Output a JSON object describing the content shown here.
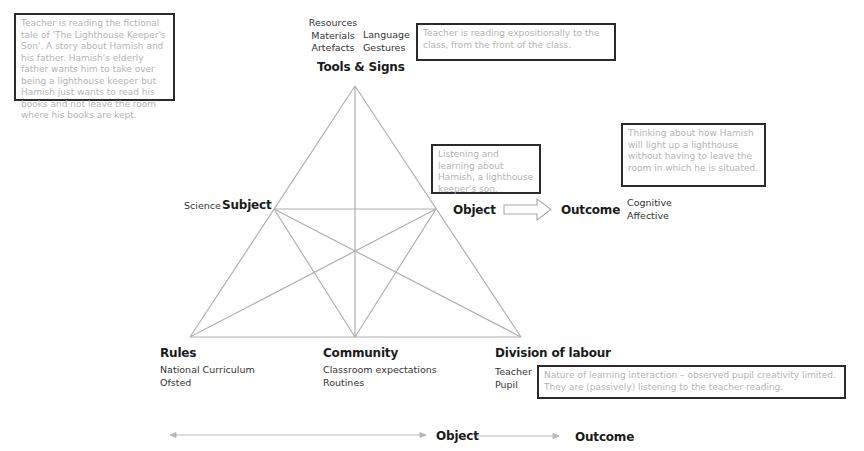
{
  "notes": {
    "tools_context": "Teacher is reading the fictional tale of 'The Lighthouse Keeper's Son'. A story about Hamish and his father. Hamish's elderly father wants him to take over being a lighthouse keeper but Hamish just wants to read his books and not leave the room where his books are kept.",
    "tools_signs": "Teacher is reading expositionally to the class, from the front of the class.",
    "object": "Listening and learning about Hamish, a lighthouse keeper's son.",
    "outcome": "Thinking about how Hamish will light up a lighthouse without having to leave the room in which he is situated.",
    "division_of_labour": "Nature of learning interaction – observed pupil creativity limited. They are (passively) listening to the teacher reading."
  },
  "nodes": {
    "tools": {
      "title": "Tools & Signs",
      "items_left": [
        "Resources",
        "Materials",
        "Artefacts"
      ],
      "items_right": [
        "Language",
        "Gestures"
      ]
    },
    "subject": {
      "title": "Subject",
      "prefix": "Science"
    },
    "object": {
      "title": "Object"
    },
    "outcome": {
      "title": "Outcome",
      "items": [
        "Cognitive",
        "Affective"
      ]
    },
    "rules": {
      "title": "Rules",
      "items": [
        "National Curriculum",
        "Ofsted"
      ]
    },
    "community": {
      "title": "Community",
      "items": [
        "Classroom expectations",
        "Routines"
      ]
    },
    "division": {
      "title": "Division of labour",
      "items": [
        "Teacher",
        "Pupil"
      ]
    }
  },
  "bottom_axis": {
    "object_label": "Object",
    "outcome_label": "Outcome"
  },
  "colors": {
    "line": "#b0b0b0",
    "note_border": "#2a2a2a",
    "note_text": "#b4b4b4",
    "title_text": "#1b1b1b"
  }
}
